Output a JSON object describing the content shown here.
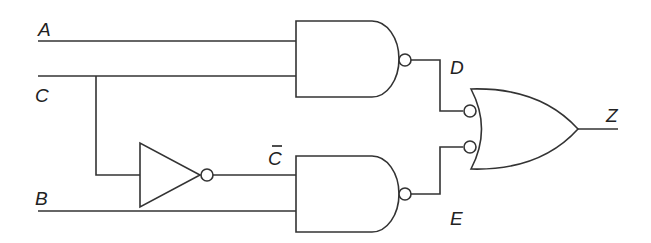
{
  "diagram": {
    "type": "logic-circuit",
    "inputs": {
      "a": "A",
      "c": "C",
      "b": "B"
    },
    "signals": {
      "c_not": "C",
      "d": "D",
      "e": "E"
    },
    "output": {
      "z": "Z"
    },
    "gates": [
      {
        "id": "nand1",
        "type": "NAND",
        "inputs": [
          "A",
          "C"
        ],
        "output": "D"
      },
      {
        "id": "not1",
        "type": "NOT",
        "inputs": [
          "C"
        ],
        "output": "C̄"
      },
      {
        "id": "nand2",
        "type": "NAND",
        "inputs": [
          "C̄",
          "B"
        ],
        "output": "E"
      },
      {
        "id": "or1",
        "type": "OR (inverted inputs)",
        "inputs": [
          "D",
          "E"
        ],
        "output": "Z"
      }
    ],
    "colors": {
      "line": "#333333",
      "background": "#ffffff"
    }
  }
}
